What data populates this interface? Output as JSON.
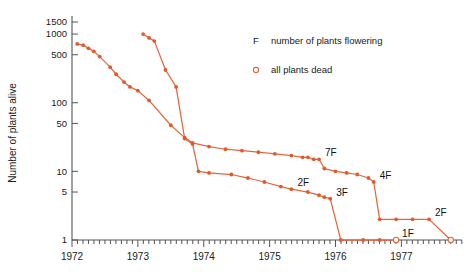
{
  "chart_data": {
    "type": "line",
    "title": "",
    "xlabel": "",
    "ylabel": "Number of plants alive",
    "yscale": "log",
    "ylim": [
      1,
      1500
    ],
    "xlim": [
      1972.0,
      1977.92
    ],
    "ytick_labels": [
      "1500",
      "1000",
      "500",
      "100",
      "50",
      "10",
      "5",
      "1"
    ],
    "ytick_values": [
      1500,
      1000,
      500,
      100,
      50,
      10,
      5,
      1
    ],
    "xtick_labels": [
      "1972",
      "1973",
      "1974",
      "1975",
      "1976",
      "1977"
    ],
    "xtick_values": [
      1972,
      1973,
      1974,
      1975,
      1976,
      1977
    ],
    "minor_xticks_per_year": 12,
    "grid": false,
    "legend_position": "upper-right",
    "legend": [
      {
        "marker": "F",
        "label": "number of plants flowering"
      },
      {
        "marker": "open-circle",
        "label": "all plants dead"
      }
    ],
    "series": [
      {
        "name": "cohort-1972",
        "color": "#e8663c",
        "ends_dead": true,
        "points": [
          [
            1972.08,
            720
          ],
          [
            1972.17,
            690
          ],
          [
            1972.25,
            620
          ],
          [
            1972.33,
            560
          ],
          [
            1972.42,
            470
          ],
          [
            1972.58,
            330
          ],
          [
            1972.67,
            260
          ],
          [
            1972.79,
            200
          ],
          [
            1972.88,
            170
          ],
          [
            1973.0,
            150
          ],
          [
            1973.17,
            108
          ],
          [
            1973.5,
            47
          ],
          [
            1973.71,
            31
          ],
          [
            1973.83,
            26
          ],
          [
            1974.08,
            23
          ],
          [
            1974.33,
            21
          ],
          [
            1974.58,
            20
          ],
          [
            1974.83,
            19
          ],
          [
            1975.08,
            18
          ],
          [
            1975.33,
            17
          ],
          [
            1975.5,
            16
          ],
          [
            1975.58,
            16
          ],
          [
            1975.67,
            15
          ],
          [
            1975.75,
            15
          ],
          [
            1975.83,
            11
          ],
          [
            1976.0,
            10
          ],
          [
            1976.17,
            9.5
          ],
          [
            1976.33,
            9
          ],
          [
            1976.5,
            8
          ],
          [
            1976.58,
            7
          ],
          [
            1976.67,
            2
          ],
          [
            1976.92,
            2
          ],
          [
            1977.17,
            2
          ],
          [
            1977.42,
            2
          ],
          [
            1977.75,
            1
          ]
        ],
        "flowering_annotations": [
          {
            "label": "7F",
            "x": 1975.75,
            "y": 15
          },
          {
            "label": "4F",
            "x": 1976.58,
            "y": 7
          },
          {
            "label": "2F",
            "x": 1977.42,
            "y": 2
          }
        ]
      },
      {
        "name": "cohort-1973",
        "color": "#e8663c",
        "ends_dead": true,
        "points": [
          [
            1973.08,
            1000
          ],
          [
            1973.17,
            880
          ],
          [
            1973.25,
            790
          ],
          [
            1973.42,
            300
          ],
          [
            1973.58,
            170
          ],
          [
            1973.71,
            30
          ],
          [
            1973.83,
            25
          ],
          [
            1973.92,
            10
          ],
          [
            1974.08,
            9.5
          ],
          [
            1974.42,
            9
          ],
          [
            1974.67,
            8
          ],
          [
            1974.92,
            7
          ],
          [
            1975.17,
            6
          ],
          [
            1975.33,
            5.5
          ],
          [
            1975.58,
            5
          ],
          [
            1975.75,
            4.5
          ],
          [
            1975.83,
            4.2
          ],
          [
            1975.92,
            4
          ],
          [
            1976.08,
            1
          ],
          [
            1976.42,
            1
          ],
          [
            1976.67,
            1
          ],
          [
            1976.92,
            1
          ]
        ],
        "flowering_annotations": [
          {
            "label": "2F",
            "x": 1975.33,
            "y": 5.5
          },
          {
            "label": "3F",
            "x": 1975.92,
            "y": 4
          },
          {
            "label": "1F",
            "x": 1976.92,
            "y": 1
          }
        ]
      }
    ]
  }
}
